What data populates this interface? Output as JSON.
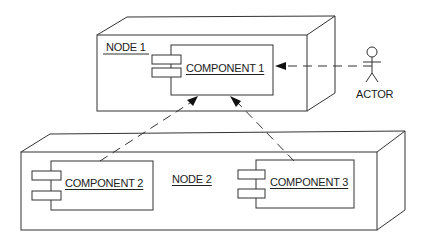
{
  "diagram": {
    "type": "UML deployment diagram",
    "nodes": [
      {
        "id": "node1",
        "label": "NODE 1",
        "components": [
          "component1"
        ]
      },
      {
        "id": "node2",
        "label": "NODE 2",
        "components": [
          "component2",
          "component3"
        ]
      }
    ],
    "components": [
      {
        "id": "component1",
        "label": "COMPONENT 1"
      },
      {
        "id": "component2",
        "label": "COMPONENT 2"
      },
      {
        "id": "component3",
        "label": "COMPONENT 3"
      }
    ],
    "actor": {
      "label": "ACTOR"
    },
    "dependencies": [
      {
        "from": "actor",
        "to": "component1",
        "style": "dashed-arrow"
      },
      {
        "from": "component2",
        "to": "component1",
        "style": "dashed-arrow"
      },
      {
        "from": "component3",
        "to": "component1",
        "style": "dashed-arrow"
      }
    ],
    "colors": {
      "line": "#333333",
      "background": "#ffffff"
    }
  }
}
